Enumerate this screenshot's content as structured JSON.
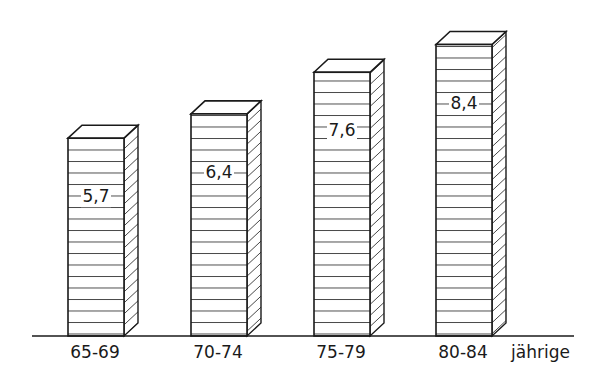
{
  "chart_data": {
    "type": "bar",
    "style": "3d hatched bars, black and white",
    "title": "",
    "xlabel": "jährige",
    "ylabel": "",
    "categories": [
      "65-69",
      "70-74",
      "75-79",
      "80-84"
    ],
    "values": [
      5.7,
      6.4,
      7.6,
      8.4
    ],
    "value_labels": [
      "5,7",
      "6,4",
      "7,6",
      "8,4"
    ],
    "grid": false,
    "legend": null,
    "ylim": [
      0,
      9
    ]
  },
  "axis": {
    "unit_label": "jährige"
  },
  "colors": {
    "ink": "#1a1a1a",
    "background": "#ffffff"
  }
}
